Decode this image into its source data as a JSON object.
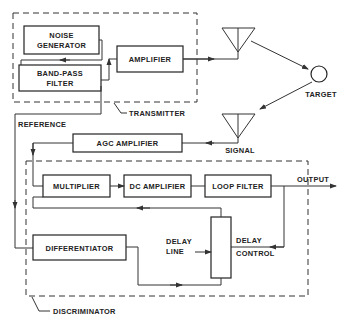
{
  "diagram": {
    "type": "block-diagram",
    "groups": {
      "transmitter": "TRANSMITTER",
      "discriminator": "DISCRIMINATOR"
    },
    "blocks": {
      "noise_generator": [
        "NOISE",
        "GENERATOR"
      ],
      "band_pass_filter": [
        "BAND-PASS",
        "FILTER"
      ],
      "amplifier": "AMPLIFIER",
      "agc_amplifier": "AGC AMPLIFIER",
      "multiplier": "MULTIPLIER",
      "dc_amplifier": "DC AMPLIFIER",
      "loop_filter": "LOOP FILTER",
      "differentiator": "DIFFERENTIATOR"
    },
    "labels": {
      "target": "TARGET",
      "signal": "SIGNAL",
      "reference": "REFERENCE",
      "output": "OUTPUT",
      "delay_line": [
        "DELAY",
        "LINE"
      ],
      "delay_control": [
        "DELAY",
        "CONTROL"
      ]
    },
    "connections": [
      {
        "from": "noise_generator",
        "to": "band_pass_filter"
      },
      {
        "from": "band_pass_filter",
        "to": "amplifier"
      },
      {
        "from": "amplifier",
        "to": "transmit_antenna"
      },
      {
        "from": "transmit_antenna",
        "to": "target"
      },
      {
        "from": "target",
        "to": "receive_antenna"
      },
      {
        "from": "receive_antenna",
        "to": "agc_amplifier"
      },
      {
        "from": "agc_amplifier",
        "to": "multiplier"
      },
      {
        "from": "band_pass_filter",
        "to": "differentiator",
        "label": "REFERENCE"
      },
      {
        "from": "differentiator",
        "to": "delay_line"
      },
      {
        "from": "delay_line",
        "to": "multiplier"
      },
      {
        "from": "multiplier",
        "to": "dc_amplifier"
      },
      {
        "from": "dc_amplifier",
        "to": "loop_filter"
      },
      {
        "from": "loop_filter",
        "to": "output"
      },
      {
        "from": "loop_filter",
        "to": "delay_line",
        "label": "DELAY CONTROL"
      }
    ]
  }
}
